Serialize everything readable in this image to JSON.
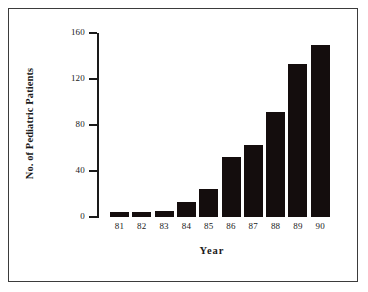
{
  "chart_data": {
    "type": "bar",
    "title": "",
    "xlabel": "Year",
    "ylabel": "No. of Pediatric Patients",
    "categories": [
      "81",
      "82",
      "83",
      "84",
      "85",
      "86",
      "87",
      "88",
      "89",
      "90"
    ],
    "values": [
      4,
      4,
      5,
      13,
      24,
      52,
      63,
      91,
      133,
      150
    ],
    "ylim": [
      0,
      160
    ],
    "yticks": [
      0,
      40,
      80,
      120,
      160
    ],
    "ytick_labels": [
      "0",
      "40",
      "80",
      "120",
      "160"
    ],
    "grid": false,
    "legend": null,
    "bar_color": "#140d0d",
    "axis_color": "#1a1a1a",
    "background_color": "#ffffff",
    "frame_color": "#3b3b3b",
    "series": [
      {
        "name": "No. of Pediatric Patients",
        "values": [
          4,
          4,
          5,
          13,
          24,
          52,
          63,
          91,
          133,
          150
        ]
      }
    ]
  }
}
